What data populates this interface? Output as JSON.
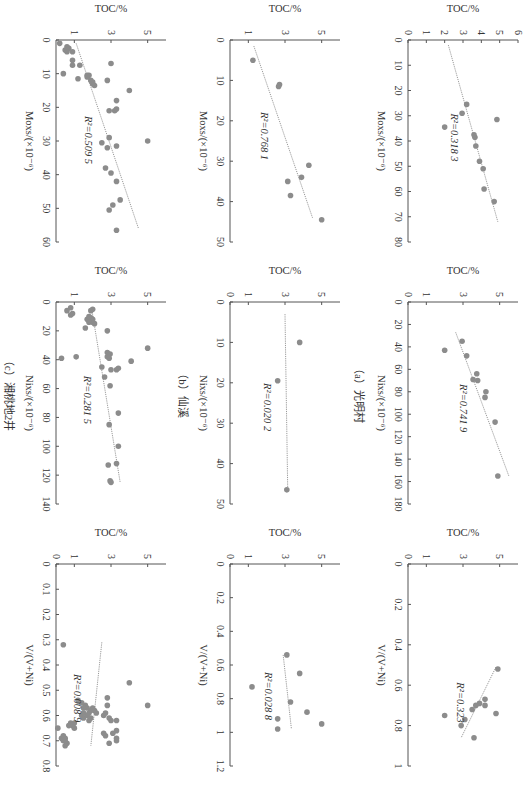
{
  "figure": {
    "captions": [
      "（a）光明村",
      "（b）仙溪",
      "（c）湘桃地2井"
    ],
    "rotation": "90deg clockwise",
    "point_color": "#8c8c8c",
    "line_color": "#9a9a9a"
  },
  "chart_data": [
    {
      "panel": "a-Mo",
      "site": "光明村",
      "type": "scatter",
      "xlabel": "Mo_xs/(×10^-6)",
      "ylabel": "TOC/%",
      "xlim": [
        0,
        80
      ],
      "xticks": [
        0,
        10,
        20,
        30,
        40,
        50,
        60,
        70,
        80
      ],
      "ylim": [
        0,
        6
      ],
      "yticks": [
        0,
        1,
        2,
        3,
        4,
        5,
        6
      ],
      "r2_label": "R²=0.318 3",
      "trend": [
        [
          2,
          2.2
        ],
        [
          72,
          4.9
        ]
      ],
      "points": [
        [
          64,
          4.7
        ],
        [
          59,
          4.15
        ],
        [
          51,
          4.1
        ],
        [
          48,
          3.9
        ],
        [
          42,
          3.7
        ],
        [
          38.5,
          3.65
        ],
        [
          37.5,
          3.6
        ],
        [
          34.5,
          2.0
        ],
        [
          31.5,
          4.85
        ],
        [
          29,
          2.95
        ],
        [
          25.5,
          3.2
        ]
      ]
    },
    {
      "panel": "a-Ni",
      "site": "光明村",
      "type": "scatter",
      "xlabel": "Ni_xs/(×10^-6)",
      "ylabel": "TOC/%",
      "xlim": [
        0,
        180
      ],
      "xticks": [
        0,
        20,
        40,
        60,
        80,
        100,
        120,
        140,
        160,
        180
      ],
      "ylim": [
        0,
        6
      ],
      "yticks": [
        0,
        1,
        3,
        5
      ],
      "r2_label": "R²=0.741 9",
      "trend": [
        [
          27,
          2.6
        ],
        [
          155,
          5.5
        ]
      ],
      "points": [
        [
          155,
          4.9
        ],
        [
          107,
          4.75
        ],
        [
          85,
          4.2
        ],
        [
          80,
          4.25
        ],
        [
          70,
          3.8
        ],
        [
          69,
          3.55
        ],
        [
          64,
          3.75
        ],
        [
          48,
          3.2
        ],
        [
          43,
          2.0
        ],
        [
          35,
          2.95
        ]
      ]
    },
    {
      "panel": "a-V",
      "site": "光明村",
      "type": "scatter",
      "xlabel": "V/(V+Ni)",
      "ylabel": "TOC/%",
      "xlim": [
        0,
        1.0
      ],
      "xticks": [
        0,
        0.2,
        0.4,
        0.6,
        0.8,
        1.0
      ],
      "ylim": [
        0,
        6
      ],
      "yticks": [
        0,
        1,
        3,
        5
      ],
      "r2_label": "R²=0.323",
      "trend": [
        [
          0.51,
          4.8
        ],
        [
          0.86,
          2.9
        ]
      ],
      "points": [
        [
          0.52,
          4.9
        ],
        [
          0.74,
          4.8
        ],
        [
          0.7,
          4.2
        ],
        [
          0.67,
          4.2
        ],
        [
          0.69,
          3.9
        ],
        [
          0.7,
          3.7
        ],
        [
          0.72,
          3.5
        ],
        [
          0.86,
          3.6
        ],
        [
          0.77,
          3.1
        ],
        [
          0.8,
          2.9
        ],
        [
          0.75,
          2.0
        ]
      ]
    },
    {
      "panel": "b-Mo",
      "site": "仙溪",
      "type": "scatter",
      "xlabel": "Mo_xs/(×10^-6)",
      "ylabel": "TOC/%",
      "xlim": [
        0,
        50
      ],
      "xticks": [
        0,
        10,
        20,
        30,
        40,
        50
      ],
      "ylim": [
        0,
        6
      ],
      "yticks": [
        1,
        3,
        5
      ],
      "r2_label": "R²=0.768 1",
      "trend": [
        [
          1.5,
          1.3
        ],
        [
          44,
          4.5
        ]
      ],
      "points": [
        [
          44.5,
          5.0
        ],
        [
          38.5,
          3.3
        ],
        [
          35,
          3.15
        ],
        [
          34,
          3.9
        ],
        [
          31,
          4.3
        ],
        [
          11.5,
          2.65
        ],
        [
          11,
          2.7
        ],
        [
          5,
          1.25
        ]
      ]
    },
    {
      "panel": "b-Ni",
      "site": "仙溪",
      "type": "scatter",
      "xlabel": "Ni_xs/(×10^-6)",
      "ylabel": "TOC/%",
      "xlim": [
        0,
        50
      ],
      "xticks": [
        0,
        10,
        20,
        30,
        40,
        50
      ],
      "ylim": [
        0,
        6
      ],
      "yticks": [
        0,
        1,
        3,
        5
      ],
      "r2_label": "R²=0.020 2",
      "trend": [
        [
          3,
          3.0
        ],
        [
          47,
          3.15
        ]
      ],
      "points": [
        [
          46.5,
          3.1
        ],
        [
          19.5,
          2.6
        ],
        [
          10,
          3.8
        ]
      ]
    },
    {
      "panel": "b-V",
      "site": "仙溪",
      "type": "scatter",
      "xlabel": "V/(V+Ni)",
      "ylabel": "TOC/%",
      "xlim": [
        0,
        1.2
      ],
      "xticks": [
        0,
        0.2,
        0.4,
        0.6,
        0.8,
        1.0,
        1.2
      ],
      "ylim": [
        0,
        6
      ],
      "yticks": [
        0,
        1,
        3,
        5
      ],
      "r2_label": "R²=0.028 8",
      "trend": [
        [
          0.54,
          2.9
        ],
        [
          0.98,
          3.35
        ]
      ],
      "points": [
        [
          0.95,
          5.0
        ],
        [
          0.88,
          4.2
        ],
        [
          0.98,
          2.6
        ],
        [
          0.92,
          2.6
        ],
        [
          0.82,
          3.3
        ],
        [
          0.73,
          1.2
        ],
        [
          0.65,
          3.8
        ],
        [
          0.54,
          3.1
        ]
      ]
    },
    {
      "panel": "c-Mo",
      "site": "湘桃地2井",
      "type": "scatter",
      "xlabel": "Mo_xs/(×10^-6)",
      "ylabel": "TOC/%",
      "xlim": [
        0,
        60
      ],
      "xticks": [
        0,
        10,
        20,
        30,
        40,
        50,
        60
      ],
      "ylim": [
        0,
        6
      ],
      "yticks": [
        1,
        3,
        5
      ],
      "r2_label": "R²=0.509 5",
      "trend": [
        [
          1,
          1.1
        ],
        [
          56,
          4.5
        ]
      ],
      "points": [
        [
          56.5,
          3.3
        ],
        [
          50.5,
          2.9
        ],
        [
          49,
          3.1
        ],
        [
          47.5,
          3.5
        ],
        [
          42,
          3.3
        ],
        [
          39.5,
          3.0
        ],
        [
          38,
          2.7
        ],
        [
          32,
          2.8
        ],
        [
          31.5,
          3.3
        ],
        [
          30.5,
          2.5
        ],
        [
          29,
          2.9
        ],
        [
          30,
          5.0
        ],
        [
          21,
          3.2
        ],
        [
          20.5,
          3.3
        ],
        [
          21,
          2.9
        ],
        [
          18,
          3.3
        ],
        [
          15,
          4.0
        ],
        [
          13.5,
          2.1
        ],
        [
          13,
          2.0
        ],
        [
          12.5,
          2.0
        ],
        [
          12,
          2.8
        ],
        [
          12,
          1.9
        ],
        [
          11,
          1.7
        ],
        [
          10.5,
          1.8
        ],
        [
          10.5,
          1.7
        ],
        [
          11.5,
          1.2
        ],
        [
          10,
          0.4
        ],
        [
          7.5,
          1.3
        ],
        [
          7,
          3.0
        ],
        [
          7.5,
          0.9
        ],
        [
          6,
          0.9
        ],
        [
          3.5,
          0.9
        ],
        [
          3.5,
          0.6
        ],
        [
          3,
          0.5
        ],
        [
          2.5,
          0.7
        ],
        [
          2,
          0.6
        ],
        [
          1,
          0.2
        ]
      ]
    },
    {
      "panel": "c-Ni",
      "site": "湘桃地2井",
      "type": "scatter",
      "xlabel": "Ni_xs/(×10^-6)",
      "ylabel": "TOC/%",
      "xlim": [
        0,
        140
      ],
      "xticks": [
        0,
        20,
        40,
        60,
        80,
        100,
        120,
        140
      ],
      "ylim": [
        0,
        6
      ],
      "yticks": [
        1,
        3,
        5
      ],
      "r2_label": "R²=0.281 5",
      "trend": [
        [
          5,
          1.95
        ],
        [
          125,
          3.5
        ]
      ],
      "points": [
        [
          125,
          3.0
        ],
        [
          124,
          2.95
        ],
        [
          112,
          3.3
        ],
        [
          113,
          2.85
        ],
        [
          100,
          3.4
        ],
        [
          85,
          2.9
        ],
        [
          77,
          3.4
        ],
        [
          58,
          2.95
        ],
        [
          52,
          2.65
        ],
        [
          47,
          3.3
        ],
        [
          46,
          3.4
        ],
        [
          47,
          3.0
        ],
        [
          45,
          2.5
        ],
        [
          41,
          4.1
        ],
        [
          39,
          2.9
        ],
        [
          38,
          2.8
        ],
        [
          38,
          1.1
        ],
        [
          39,
          0.3
        ],
        [
          35,
          2.8
        ],
        [
          36,
          2.95
        ],
        [
          32,
          5.0
        ],
        [
          20,
          2.8
        ],
        [
          18,
          1.6
        ],
        [
          15,
          2.1
        ],
        [
          14,
          2.0
        ],
        [
          13,
          1.9
        ],
        [
          12,
          2.0
        ],
        [
          14,
          1.8
        ],
        [
          12,
          1.7
        ],
        [
          11,
          1.9
        ],
        [
          10,
          1.8
        ],
        [
          9,
          0.8
        ],
        [
          8,
          0.9
        ],
        [
          6,
          1.9
        ],
        [
          5,
          2.0
        ],
        [
          6,
          0.6
        ],
        [
          4,
          0.8
        ]
      ]
    },
    {
      "panel": "c-V",
      "site": "湘桃地2井",
      "type": "scatter",
      "xlabel": "V/(V+Ni)",
      "ylabel": "TOC/%",
      "xlim": [
        0,
        0.8
      ],
      "xticks": [
        0,
        0.1,
        0.2,
        0.3,
        0.4,
        0.5,
        0.6,
        0.7,
        0.8
      ],
      "ylim": [
        0,
        6
      ],
      "yticks": [
        0,
        1,
        3,
        5
      ],
      "r2_label": "R²=0.008 9",
      "trend": [
        [
          0.31,
          2.5
        ],
        [
          0.72,
          1.9
        ]
      ],
      "points": [
        [
          0.56,
          5.0
        ],
        [
          0.47,
          4.0
        ],
        [
          0.7,
          3.3
        ],
        [
          0.71,
          2.9
        ],
        [
          0.69,
          3.3
        ],
        [
          0.67,
          3.1
        ],
        [
          0.66,
          3.3
        ],
        [
          0.68,
          2.7
        ],
        [
          0.67,
          2.6
        ],
        [
          0.62,
          3.3
        ],
        [
          0.62,
          3.0
        ],
        [
          0.61,
          2.9
        ],
        [
          0.6,
          2.6
        ],
        [
          0.59,
          2.7
        ],
        [
          0.59,
          2.2
        ],
        [
          0.58,
          2.1
        ],
        [
          0.58,
          1.9
        ],
        [
          0.57,
          2.0
        ],
        [
          0.57,
          1.7
        ],
        [
          0.56,
          2.8
        ],
        [
          0.56,
          1.6
        ],
        [
          0.55,
          1.4
        ],
        [
          0.53,
          2.8
        ],
        [
          0.54,
          1.2
        ],
        [
          0.62,
          1.8
        ],
        [
          0.61,
          1.9
        ],
        [
          0.61,
          1.5
        ],
        [
          0.6,
          1.7
        ],
        [
          0.6,
          1.4
        ],
        [
          0.59,
          1.5
        ],
        [
          0.59,
          1.8
        ],
        [
          0.57,
          1.5
        ],
        [
          0.64,
          0.7
        ],
        [
          0.65,
          1.0
        ],
        [
          0.64,
          0.9
        ],
        [
          0.63,
          1.0
        ],
        [
          0.63,
          0.8
        ],
        [
          0.71,
          0.6
        ],
        [
          0.72,
          0.5
        ],
        [
          0.7,
          0.5
        ],
        [
          0.7,
          0.4
        ],
        [
          0.69,
          0.3
        ],
        [
          0.69,
          0.5
        ],
        [
          0.68,
          0.4
        ],
        [
          0.65,
          0.1
        ],
        [
          0.32,
          0.4
        ]
      ]
    }
  ]
}
